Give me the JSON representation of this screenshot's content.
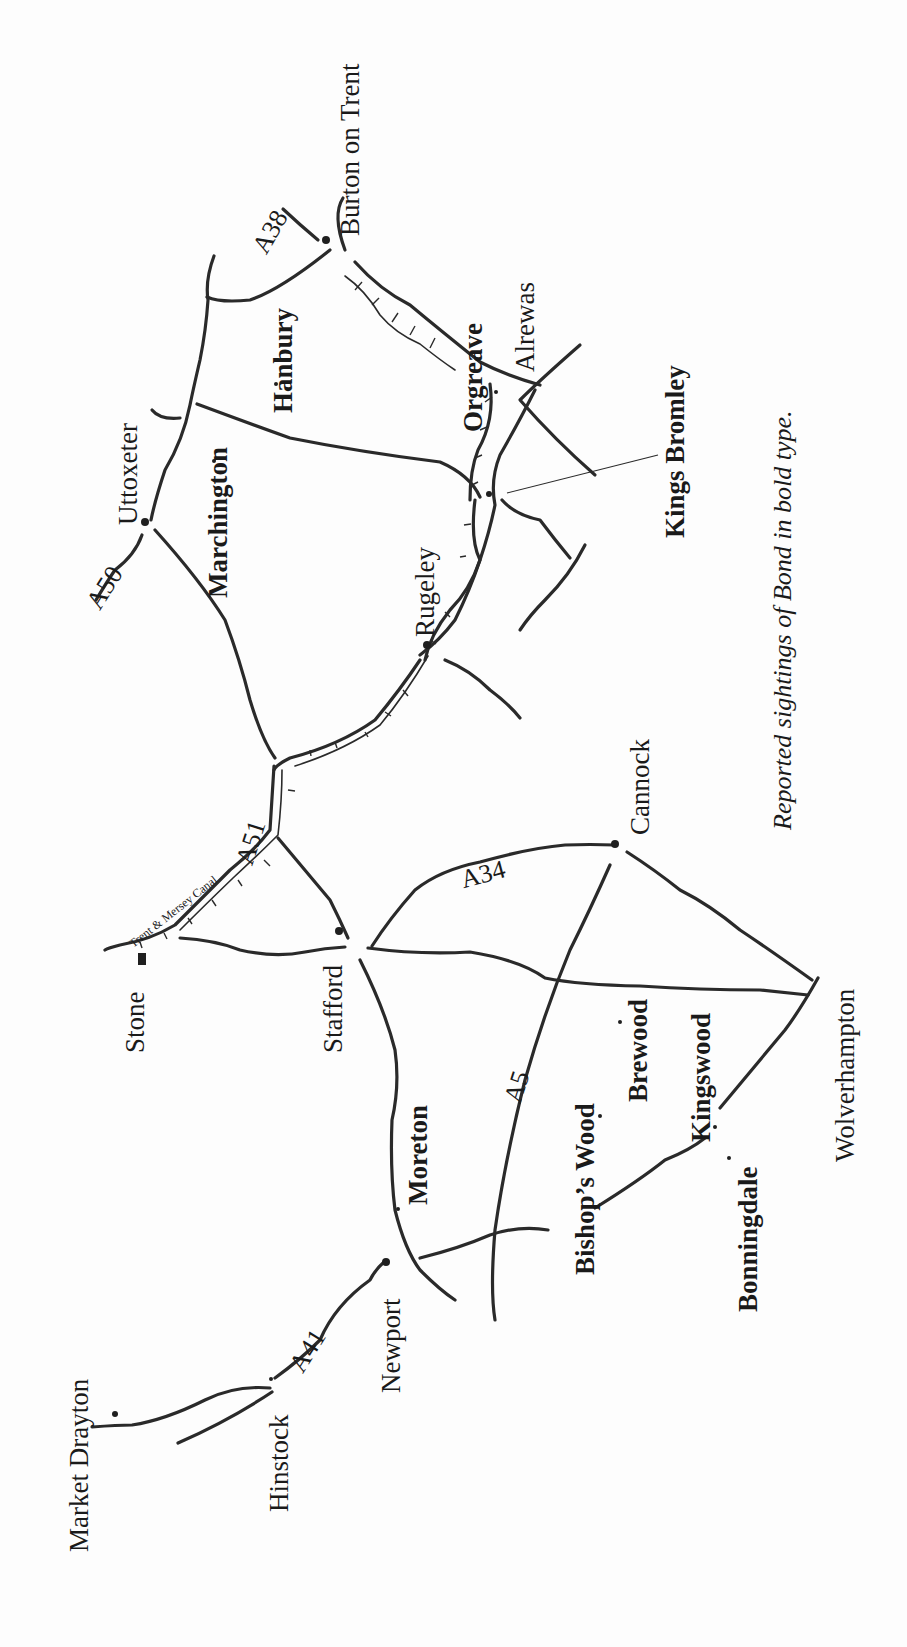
{
  "map": {
    "orientation": "rotated 90° counter-clockwise",
    "caption": "Reported sightings of Bond in bold type.",
    "places": {
      "burton_on_trent": {
        "label": "Burton on Trent",
        "bold": false
      },
      "uttoxeter": {
        "label": "Uttoxeter",
        "bold": false
      },
      "hanbury": {
        "label": "Hanbury",
        "bold": true
      },
      "marchington": {
        "label": "Marchington",
        "bold": true
      },
      "orgreave": {
        "label": "Orgreave",
        "bold": true
      },
      "alrewas": {
        "label": "Alrewas",
        "bold": false
      },
      "kings_bromley": {
        "label": "Kings Bromley",
        "bold": true
      },
      "rugeley": {
        "label": "Rugeley",
        "bold": false
      },
      "cannock": {
        "label": "Cannock",
        "bold": false
      },
      "stone": {
        "label": "Stone",
        "bold": false
      },
      "stafford": {
        "label": "Stafford",
        "bold": false
      },
      "moreton": {
        "label": "Moreton",
        "bold": true
      },
      "bishops_wood": {
        "label": "Bishop’s Wood",
        "bold": true
      },
      "brewood": {
        "label": "Brewood",
        "bold": true
      },
      "kingswood": {
        "label": "Kingswood",
        "bold": true
      },
      "bonningdale": {
        "label": "Bonningdale",
        "bold": true
      },
      "wolverhampton": {
        "label": "Wolverhampton",
        "bold": false
      },
      "newport": {
        "label": "Newport",
        "bold": false
      },
      "hinstock": {
        "label": "Hinstock",
        "bold": false
      },
      "market_drayton": {
        "label": "Market Drayton",
        "bold": false
      }
    },
    "roads": {
      "a38": "A38",
      "a50": "A50",
      "a51": "A51",
      "a34": "A34",
      "a5": "A5",
      "a41": "A41"
    },
    "canal": {
      "label": "Trent & Mersey Canal"
    }
  }
}
